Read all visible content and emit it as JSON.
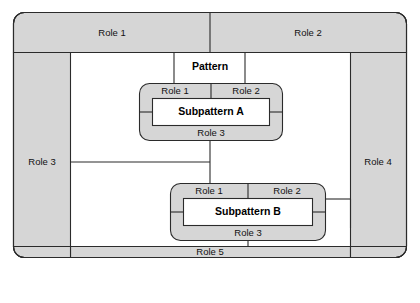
{
  "diagram": {
    "colors": {
      "band_fill": "#d6d6d6",
      "subpattern_fill": "#d6d6d6",
      "inner_box_fill": "#ffffff",
      "stroke": "#2b2b2b",
      "background": "#ffffff",
      "text": "#111111"
    },
    "outer_pattern": {
      "name": "Pattern",
      "center_label": "Pattern",
      "bands": {
        "top_left": "Role 1",
        "top_right": "Role 2",
        "left": "Role 3",
        "right": "Role 4",
        "bottom": "Role 5"
      }
    },
    "subpattern_a": {
      "name": "Subpattern A",
      "center_label": "Subpattern A",
      "bands": {
        "top_left": "Role 1",
        "top_right": "Role 2",
        "bottom": "Role 3"
      }
    },
    "subpattern_b": {
      "name": "Subpattern B",
      "center_label": "Subpattern B",
      "bands": {
        "top_left": "Role 1",
        "top_right": "Role 2",
        "bottom": "Role 3"
      }
    }
  }
}
